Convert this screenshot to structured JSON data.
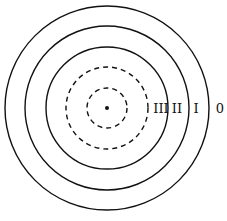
{
  "diagram": {
    "type": "concentric-zones",
    "center": {
      "x": 107,
      "y": 108
    },
    "center_dot": true,
    "rings": [
      {
        "radius": 102,
        "style": "solid"
      },
      {
        "radius": 82,
        "style": "solid"
      },
      {
        "radius": 61,
        "style": "solid"
      },
      {
        "radius": 41,
        "style": "dashed"
      },
      {
        "radius": 21,
        "style": "dashed"
      }
    ],
    "labels": {
      "zone_3": "III",
      "zone_2": "II",
      "zone_1": "I",
      "zone_0": "0"
    },
    "stroke_color": "#111111"
  }
}
